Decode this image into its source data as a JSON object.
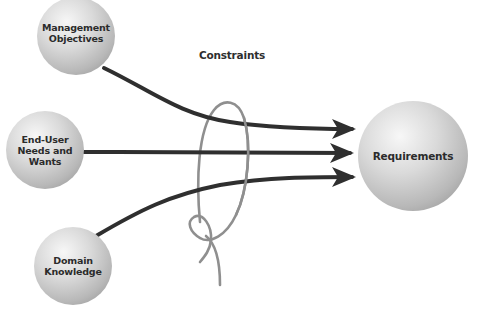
{
  "diagram": {
    "colors": {
      "background": "#ffffff",
      "arrow": "#2f2f2f",
      "constraint_loop": "#8f8f8f",
      "sphere_light": "#f4f4f4",
      "sphere_mid": "#cfcfcf",
      "sphere_dark": "#9c9c9c",
      "text": "#2b2b2b"
    },
    "sources": [
      {
        "id": "management",
        "label": "Management\nObjectives"
      },
      {
        "id": "end-user",
        "label": "End-User\nNeeds and\nWants"
      },
      {
        "id": "domain",
        "label": "Domain\nKnowledge"
      }
    ],
    "target": {
      "id": "requirements",
      "label": "Requirements"
    },
    "constraint": {
      "label": "Constraints",
      "icon": "rope-loop-knot-icon"
    },
    "edges": [
      {
        "from": "management",
        "to": "requirements",
        "style": "arrow"
      },
      {
        "from": "end-user",
        "to": "requirements",
        "style": "arrow"
      },
      {
        "from": "domain",
        "to": "requirements",
        "style": "arrow"
      }
    ]
  }
}
